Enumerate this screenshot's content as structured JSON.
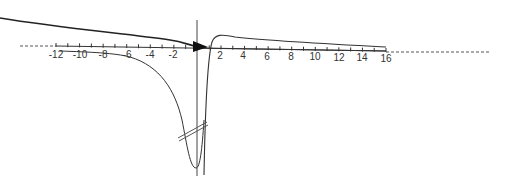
{
  "diagram": {
    "type": "function-sketch",
    "axis": {
      "ticks": [
        -12,
        -10,
        -8,
        -6,
        -4,
        -2,
        2,
        4,
        6,
        8,
        10,
        12,
        14,
        16
      ],
      "tick_labels": [
        "-12",
        "-10",
        "-8",
        "-6",
        "-4",
        "-2",
        "2",
        "4",
        "6",
        "8",
        "10",
        "12",
        "14",
        "16"
      ],
      "min": -12,
      "max": 16
    },
    "colors": {
      "curve": "#333333",
      "axis": "#333333",
      "dashed": "#555555",
      "background": "#ffffff"
    },
    "features": [
      "arrow-at-origin",
      "vertical-line-at-origin",
      "axis-break-marks",
      "dashed-axis-extensions"
    ]
  }
}
